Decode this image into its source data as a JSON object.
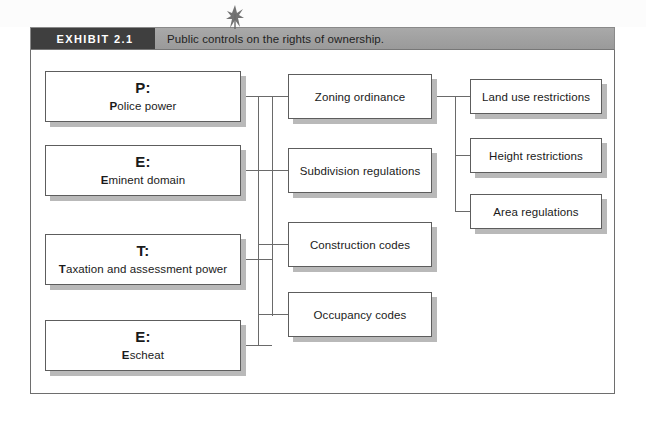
{
  "exhibit": {
    "tag": "EXHIBIT 2.1",
    "caption": "Public controls on the rights of ownership."
  },
  "colors": {
    "tag_background": "#3f3f3f",
    "header_background": "#a2a2a2",
    "box_border": "#5d5d5d",
    "box_shadow": "#b9b9b9",
    "connector": "#6a6a6a",
    "frame_border": "#6e6e6e",
    "page_background": "#ffffff"
  },
  "diagram": {
    "type": "hierarchy",
    "powers": [
      {
        "letter": "P:",
        "bold_initial": "P",
        "rest": "olice power",
        "full_label": "Police power"
      },
      {
        "letter": "E:",
        "bold_initial": "E",
        "rest": "minent domain",
        "full_label": "Eminent domain"
      },
      {
        "letter": "T:",
        "bold_initial": "T",
        "rest": "axation and assessment power",
        "full_label": "Taxation and assessment power"
      },
      {
        "letter": "E:",
        "bold_initial": "E",
        "rest": "scheat",
        "full_label": "Escheat"
      }
    ],
    "controls": [
      {
        "label": "Zoning ordinance"
      },
      {
        "label": "Subdivision regulations"
      },
      {
        "label": "Construction codes"
      },
      {
        "label": "Occupancy codes"
      }
    ],
    "restrictions": [
      {
        "label": "Land use restrictions"
      },
      {
        "label": "Height restrictions"
      },
      {
        "label": "Area regulations"
      }
    ]
  }
}
